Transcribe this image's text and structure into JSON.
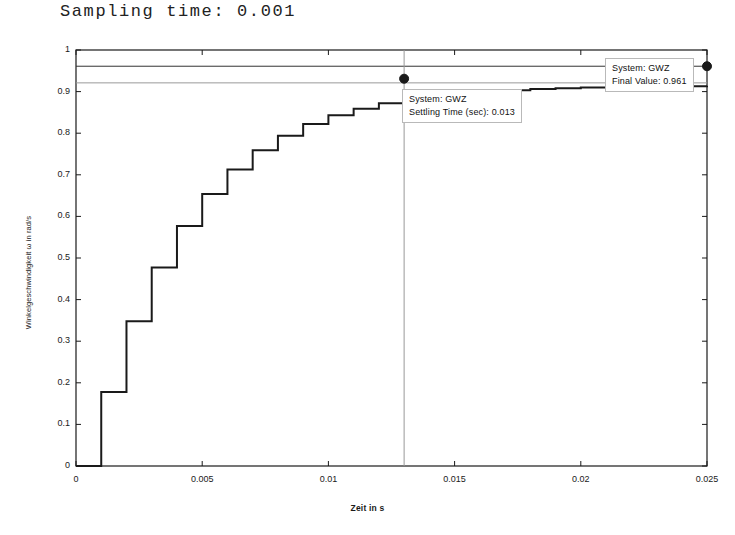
{
  "figure": {
    "title": "Sampling time: 0.001",
    "background": "#ffffff",
    "line_color": "#1a1a1a",
    "marker_color": "#1a1a1a",
    "reference_line_color": "#333333",
    "band_line_color": "#999999"
  },
  "axes": {
    "xlabel": "Zeit in s",
    "ylabel": "Winkelgeschwindigkeit ω in rad/s",
    "xticks": [
      "0",
      "0.005",
      "0.01",
      "0.015",
      "0.02",
      "0.025"
    ],
    "xtick_values": [
      0,
      0.005,
      0.01,
      0.015,
      0.02,
      0.025
    ],
    "yticks": [
      "0",
      "0.1",
      "0.2",
      "0.3",
      "0.4",
      "0.5",
      "0.6",
      "0.7",
      "0.8",
      "0.9",
      "1"
    ],
    "ytick_values": [
      0,
      0.1,
      0.2,
      0.3,
      0.4,
      0.5,
      0.6,
      0.7,
      0.8,
      0.9,
      1
    ],
    "xlim": [
      0,
      0.025
    ],
    "ylim": [
      0,
      1
    ],
    "grid": false,
    "box": true
  },
  "annotations": {
    "settling": {
      "line1": "System: GWZ",
      "line2": "Settling Time (sec): 0.013",
      "marker_x": 0.013,
      "marker_y": 0.931
    },
    "final": {
      "line1": "System: GWZ",
      "line2": "Final Value: 0.961",
      "marker_x": 0.025,
      "marker_y": 0.961
    }
  },
  "chart_data": {
    "type": "line",
    "title": "Sampling time: 0.001",
    "xlabel": "Zeit in s",
    "ylabel": "Winkelgeschwindigkeit ω in rad/s",
    "xlim": [
      0,
      0.025
    ],
    "ylim": [
      0,
      1
    ],
    "grid": false,
    "legend": null,
    "drawstyle": "steps-post",
    "sampling_time": 0.001,
    "series": [
      {
        "name": "GWZ step response",
        "x": [
          0,
          0.001,
          0.002,
          0.003,
          0.004,
          0.005,
          0.006,
          0.007,
          0.008,
          0.009,
          0.01,
          0.011,
          0.012,
          0.013,
          0.014,
          0.015,
          0.016,
          0.017,
          0.018,
          0.019,
          0.02,
          0.021,
          0.022,
          0.023,
          0.024,
          0.025
        ],
        "values": [
          0,
          0.178,
          0.348,
          0.477,
          0.577,
          0.654,
          0.713,
          0.759,
          0.794,
          0.822,
          0.843,
          0.859,
          0.872,
          0.882,
          0.889,
          0.895,
          0.9,
          0.903,
          0.906,
          0.908,
          0.91,
          0.911,
          0.912,
          0.913,
          0.913,
          0.914
        ]
      }
    ],
    "reference_lines": [
      {
        "name": "final-value",
        "orientation": "horizontal",
        "value": 0.961,
        "label": "Final Value: 0.961"
      },
      {
        "name": "settling-band",
        "orientation": "horizontal",
        "value": 0.921,
        "label": "settling band"
      },
      {
        "name": "settling-time",
        "orientation": "vertical",
        "value": 0.013,
        "label": "Settling Time (sec): 0.013"
      }
    ],
    "markers": [
      {
        "name": "settling-point",
        "x": 0.013,
        "y": 0.931,
        "label": "Settling Time (sec): 0.013"
      },
      {
        "name": "final-value-point",
        "x": 0.025,
        "y": 0.961,
        "label": "Final Value: 0.961"
      }
    ]
  }
}
